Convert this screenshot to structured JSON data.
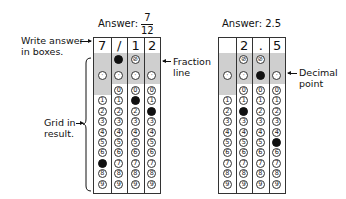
{
  "left_example": {
    "answer_label": "Answer:",
    "fraction_numerator": "7",
    "fraction_denominator": "12",
    "boxes": [
      "7",
      "/",
      "1",
      "2"
    ],
    "filled": {
      "col0": "7",
      "col1": "/",
      "col2": "1",
      "col3": "2"
    }
  },
  "right_example": {
    "answer_label": "Answer: 2.5",
    "boxes": [
      "",
      "2",
      ".",
      "5"
    ],
    "filled": {
      "col1": "2",
      "col2": ".",
      "col3": "5"
    }
  },
  "annotations": {
    "write_answer_line1": "Write answer",
    "write_answer_line2": "in boxes.",
    "grid_in_line1": "Grid in",
    "grid_in_line2": "result.",
    "fraction_line1": "Fraction",
    "fraction_line2": "line",
    "decimal_line1": "Decimal",
    "decimal_line2": "point"
  },
  "bubble_rows": {
    "slash_symbol": "⊘",
    "decimal_symbol": "·",
    "digits": [
      "0",
      "1",
      "2",
      "3",
      "4",
      "5",
      "6",
      "7",
      "8",
      "9"
    ]
  }
}
